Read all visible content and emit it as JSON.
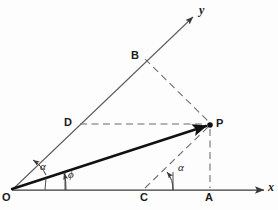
{
  "figure": {
    "background_color": "#fdfdfd",
    "ink_color": "#3a3a3a",
    "bold_ink_color": "#111111",
    "label_color": "#1a1a1a"
  },
  "axes": {
    "x": {
      "label": "x",
      "from": [
        12,
        190
      ],
      "to": [
        266,
        190
      ],
      "arrow": true
    },
    "y": {
      "label": "y",
      "from": [
        12,
        190
      ],
      "to": [
        195,
        15
      ],
      "arrow": true,
      "note": "oblique axis inclined above x-axis"
    }
  },
  "points": [
    {
      "id": "O",
      "label": "O",
      "x": 12,
      "y": 190,
      "marker": "none",
      "label_pos": [
        4,
        190
      ],
      "description": "origin"
    },
    {
      "id": "P",
      "label": "P",
      "x": 210,
      "y": 125,
      "marker": "dot",
      "label_pos": [
        216,
        124
      ],
      "description": "terminal point of vector OP"
    },
    {
      "id": "A",
      "label": "A",
      "x": 210,
      "y": 190,
      "marker": "none",
      "label_pos": [
        207,
        200
      ],
      "description": "foot of perpendicular from P on x-axis"
    },
    {
      "id": "B",
      "label": "B",
      "x": 143,
      "y": 57,
      "marker": "none",
      "label_pos": [
        133,
        56
      ],
      "description": "point on y-axis, projection of P parallel to x-axis"
    },
    {
      "id": "C",
      "label": "C",
      "x": 145,
      "y": 190,
      "marker": "none",
      "label_pos": [
        142,
        200
      ],
      "description": "point on x-axis where CP is parallel to y-axis"
    },
    {
      "id": "D",
      "label": "D",
      "x": 78,
      "y": 125,
      "marker": "none",
      "label_pos": [
        66,
        123
      ],
      "description": "point on y-axis level with P"
    }
  ],
  "segments": [
    {
      "id": "OP",
      "from": "O",
      "to": "P",
      "style": "solid-thick",
      "arrow": true,
      "description": "position vector OP"
    },
    {
      "id": "DP",
      "from": "D",
      "to": "P",
      "style": "dashed",
      "arrow": false,
      "description": "horizontal dashed line from D to P"
    },
    {
      "id": "BP",
      "from": "B",
      "to": "P",
      "style": "dashed",
      "arrow": false,
      "description": "dashed line from B to P"
    },
    {
      "id": "CP",
      "from": "C",
      "to": "P",
      "style": "dashed",
      "arrow": false,
      "description": "dashed line from C to P, parallel to y-axis"
    },
    {
      "id": "PA",
      "from": "P",
      "to": "A",
      "style": "dashed",
      "arrow": false,
      "description": "vertical dashed line from P to A"
    }
  ],
  "angles": [
    {
      "id": "alpha-at-O",
      "label": "α",
      "vertex": "O",
      "between": [
        "OP",
        "y-axis"
      ],
      "label_pos": [
        43,
        166
      ],
      "description": "angle between vector OP and the oblique y-axis"
    },
    {
      "id": "phi-at-O",
      "label": "ϕ",
      "vertex": "O",
      "between": [
        "x-axis",
        "OP"
      ],
      "label_pos": [
        68,
        173
      ],
      "description": "angle between the x-axis and vector OP"
    },
    {
      "id": "alpha-at-C",
      "label": "α",
      "vertex": "C",
      "between": [
        "x-axis",
        "CP"
      ],
      "label_pos": [
        178,
        166
      ],
      "description": "angle between the x-axis and line CP, equal to alpha"
    }
  ],
  "caption": {
    "text": "",
    "note": "caption text below the figure is cropped off at the bottom edge"
  }
}
